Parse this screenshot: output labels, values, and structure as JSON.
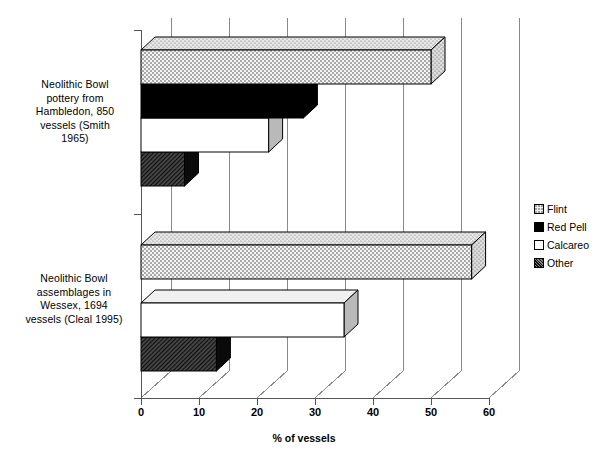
{
  "chart_data": {
    "type": "bar",
    "orientation": "horizontal",
    "style": "3d-clustered-bar",
    "title": "",
    "xlabel": "% of vessels",
    "ylabel": "",
    "xlim": [
      0,
      60
    ],
    "xticks": [
      0,
      10,
      20,
      30,
      40,
      50,
      60
    ],
    "xtick_labels": [
      "0",
      "10",
      "20",
      "30",
      "40",
      "50",
      "60"
    ],
    "grid": true,
    "grid_axis": "x",
    "legend_position": "right",
    "categories": [
      "Neolithic Bowl pottery from Hambledon, 850 vessels (Smith 1965)",
      "Neolithic Bowl assemblages in Wessex, 1694 vessels (Cleal 1995)"
    ],
    "series": [
      {
        "name": "Flint",
        "values": [
          50,
          57
        ]
      },
      {
        "name": "Red Pell",
        "values": [
          28,
          0
        ]
      },
      {
        "name": "Calcareo",
        "values": [
          22,
          35
        ]
      },
      {
        "name": "Other",
        "values": [
          7.5,
          13
        ]
      }
    ]
  },
  "axis": {
    "x_title": "% of vessels",
    "tick_labels": [
      "0",
      "10",
      "20",
      "30",
      "40",
      "50",
      "60"
    ]
  },
  "categories": [
    {
      "id": "hambledon",
      "lines": [
        "Neolithic Bowl",
        "pottery from",
        "Hambledon, 850",
        "vessels (Smith",
        "1965)"
      ]
    },
    {
      "id": "wessex",
      "lines": [
        "Neolithic Bowl",
        "assemblages in",
        "Wessex, 1694",
        "vessels (Cleal 1995)"
      ]
    }
  ],
  "legend": {
    "items": [
      {
        "label": "Flint",
        "swatch": "dotted"
      },
      {
        "label": "Red Pell",
        "swatch": "solid-black"
      },
      {
        "label": "Calcareo",
        "swatch": "white"
      },
      {
        "label": "Other",
        "swatch": "hatched"
      }
    ]
  }
}
